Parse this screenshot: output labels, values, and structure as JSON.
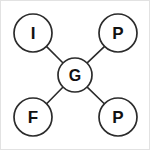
{
  "diagram": {
    "type": "star-topology-graph",
    "background_color": "#ffffff",
    "stroke_color": "#2b2b2b",
    "label_color": "#111111",
    "center_node": {
      "id": "center",
      "label": "G",
      "cx": 75,
      "cy": 75,
      "r": 17
    },
    "outer_nodes": [
      {
        "id": "top-left",
        "label": "I",
        "cx": 33,
        "cy": 33,
        "r": 19
      },
      {
        "id": "top-right",
        "label": "P",
        "cx": 118,
        "cy": 33,
        "r": 19
      },
      {
        "id": "bottom-left",
        "label": "F",
        "cx": 33,
        "cy": 117,
        "r": 19
      },
      {
        "id": "bottom-right",
        "label": "P",
        "cx": 118,
        "cy": 117,
        "r": 19
      }
    ],
    "edges": [
      {
        "id": "edge-center-top-left",
        "from": "center",
        "to": "top-left",
        "x1": 62.8,
        "y1": 62.8,
        "x2": 46.4,
        "y2": 46.4
      },
      {
        "id": "edge-center-top-right",
        "from": "center",
        "to": "top-right",
        "x1": 87.2,
        "y1": 62.8,
        "x2": 104.6,
        "y2": 46.4
      },
      {
        "id": "edge-center-bottom-left",
        "from": "center",
        "to": "bottom-left",
        "x1": 62.8,
        "y1": 87.2,
        "x2": 46.4,
        "y2": 104.0
      },
      {
        "id": "edge-center-bottom-right",
        "from": "center",
        "to": "bottom-right",
        "x1": 87.2,
        "y1": 87.2,
        "x2": 104.6,
        "y2": 104.0
      }
    ]
  }
}
